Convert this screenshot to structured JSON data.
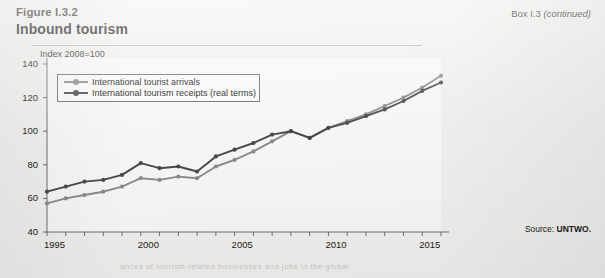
{
  "header": {
    "figure_label": "Figure I.3.2",
    "title": "Inbound tourism",
    "box_note_prefix": "Box I.3 ",
    "box_note_italic": "(continued)"
  },
  "footer": {
    "source_prefix": "Source: ",
    "source_value": "UNTWO.",
    "bleed_text": "ances of tourism-related businesses and jobs in the global"
  },
  "chart_data": {
    "type": "line",
    "title": "Inbound tourism",
    "subtitle": "Index 2008=100",
    "xlabel": "",
    "ylabel": "",
    "ylim": [
      40,
      140
    ],
    "yticks": [
      40,
      60,
      80,
      100,
      120,
      140
    ],
    "ytick_labels": [
      "40",
      "60",
      "80",
      "100",
      "120",
      "140"
    ],
    "xlim": [
      1995,
      2016
    ],
    "xticks": [
      1995,
      1996,
      1997,
      1998,
      1999,
      2000,
      2001,
      2002,
      2003,
      2004,
      2005,
      2006,
      2007,
      2008,
      2009,
      2010,
      2011,
      2012,
      2013,
      2014,
      2015,
      2016
    ],
    "xtick_labels_shown": [
      "1995",
      "2000",
      "2005",
      "2010",
      "2015"
    ],
    "xtick_labels_years": [
      1995,
      2000,
      2005,
      2010,
      2015
    ],
    "grid": false,
    "legend_position": "top-left inside",
    "x": [
      1995,
      1996,
      1997,
      1998,
      1999,
      2000,
      2001,
      2002,
      2003,
      2004,
      2005,
      2006,
      2007,
      2008,
      2009,
      2010,
      2011,
      2012,
      2013,
      2014,
      2015,
      2016
    ],
    "series": [
      {
        "name": "International tourist arrivals",
        "color": "#8d8d8d",
        "values": [
          57,
          60,
          62,
          64,
          67,
          72,
          71,
          73,
          72,
          79,
          83,
          88,
          94,
          100,
          96,
          102,
          106,
          110,
          115,
          120,
          126,
          133
        ]
      },
      {
        "name": "International tourism receipts (real terms)",
        "color": "#4a4a4a",
        "values": [
          64,
          67,
          70,
          71,
          74,
          81,
          78,
          79,
          76,
          85,
          89,
          93,
          98,
          100,
          96,
          102,
          105,
          109,
          113,
          118,
          124,
          129
        ]
      }
    ]
  }
}
